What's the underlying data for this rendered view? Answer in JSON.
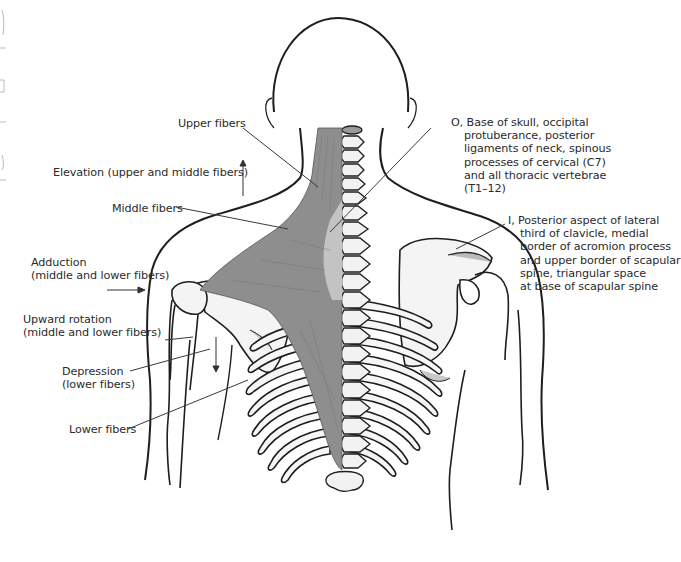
{
  "figure": {
    "colors": {
      "outline": "#1e1e1e",
      "muscle": "#8e8e8e",
      "muscle_light": "#b9b9b9",
      "bone_shade": "#d6d6d6",
      "leader_line": "#3a3a3a"
    }
  },
  "labels": {
    "upper_fibers": "Upper fibers",
    "elevation": "Elevation (upper and middle fibers)",
    "middle_fibers": "Middle fibers",
    "adduction": [
      "Adduction",
      "(middle and lower fibers)"
    ],
    "upward_rotation": [
      "Upward rotation",
      "(middle and lower fibers)"
    ],
    "depression": [
      "Depression",
      "(lower fibers)"
    ],
    "lower_fibers": "Lower fibers",
    "origin": [
      "O, Base of skull, occipital",
      "protuberance, posterior",
      "ligaments of neck, spinous",
      "processes of cervical (C7)",
      "and all thoracic vertebrae",
      "(T1–12)"
    ],
    "insertion": [
      "I, Posterior aspect of lateral",
      "third of clavicle, medial",
      "border of acromion process",
      "and upper border of scapular",
      "spine, triangular space",
      "at base of scapular spine"
    ]
  }
}
